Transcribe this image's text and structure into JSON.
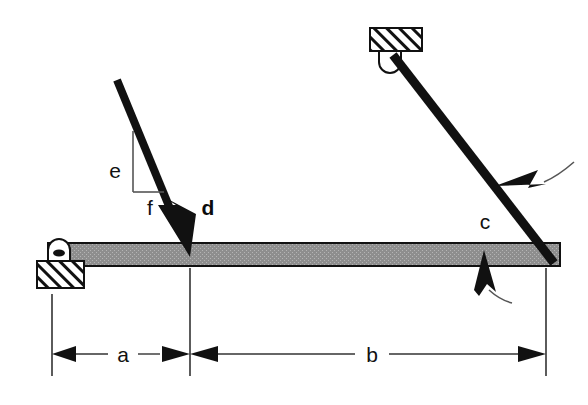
{
  "diagram": {
    "background_color": "#ffffff",
    "ink_color": "#111111",
    "beam_fill_color": "#8e8e8e",
    "beam_stroke_color": "#111111",
    "member_color": "#111111",
    "thin_line_color": "#555555"
  },
  "labels": {
    "dimension_a": "a",
    "dimension_b": "b",
    "member_c": "c",
    "load_d": "d",
    "slope_rise_e": "e",
    "slope_run_f": "f"
  },
  "elements": {
    "beam": {
      "name": "horizontal-beam",
      "x1": 48,
      "y1": 243,
      "x2": 560,
      "y2": 266
    },
    "pin_support_left": {
      "name": "pin-support-left",
      "lug_cx": 59,
      "lug_cy": 247,
      "ground_x": 37,
      "ground_y": 260,
      "ground_w": 47,
      "ground_h": 27
    },
    "pin_support_top": {
      "name": "pin-support-top",
      "ground_x": 370,
      "ground_y": 28,
      "ground_w": 52,
      "ground_h": 23,
      "lug_cx": 390,
      "lug_cy": 58
    },
    "inclined_member": {
      "name": "inclined-two-force-member",
      "x1": 393,
      "y1": 57,
      "x2": 553,
      "y2": 262,
      "thickness": 9
    },
    "load_arrow": {
      "name": "applied-load-arrow",
      "tail_x": 117,
      "tail_y": 80,
      "tip_x": 190,
      "tip_y": 257,
      "thickness": 8
    },
    "slope_triangle": {
      "name": "slope-triangle",
      "vertical_x": 133,
      "vertical_top_y": 131,
      "vertical_bottom_y": 192,
      "horizontal_x2": 163
    },
    "leader_member": {
      "name": "leader-arrow-member",
      "tip_x": 497,
      "tip_y": 183,
      "tail_x": 565,
      "tail_y": 158
    },
    "leader_beam": {
      "name": "leader-arrow-beam",
      "tip_x": 484,
      "tip_y": 250,
      "tail_x": 507,
      "tail_y": 296
    },
    "extension_lines": [
      {
        "name": "extension-line-left",
        "x": 52,
        "y1": 294,
        "y2": 375
      },
      {
        "name": "extension-line-mid",
        "x": 190,
        "y1": 268,
        "y2": 375
      },
      {
        "name": "extension-line-right",
        "x": 546,
        "y1": 268,
        "y2": 375
      }
    ],
    "dimension_lines": [
      {
        "name": "dimension-line-a",
        "y": 354,
        "x1": 52,
        "x2": 190,
        "label_x": 122,
        "label_y": 361
      },
      {
        "name": "dimension-line-b",
        "y": 354,
        "x1": 190,
        "x2": 546,
        "label_x": 371,
        "label_y": 361
      }
    ]
  }
}
